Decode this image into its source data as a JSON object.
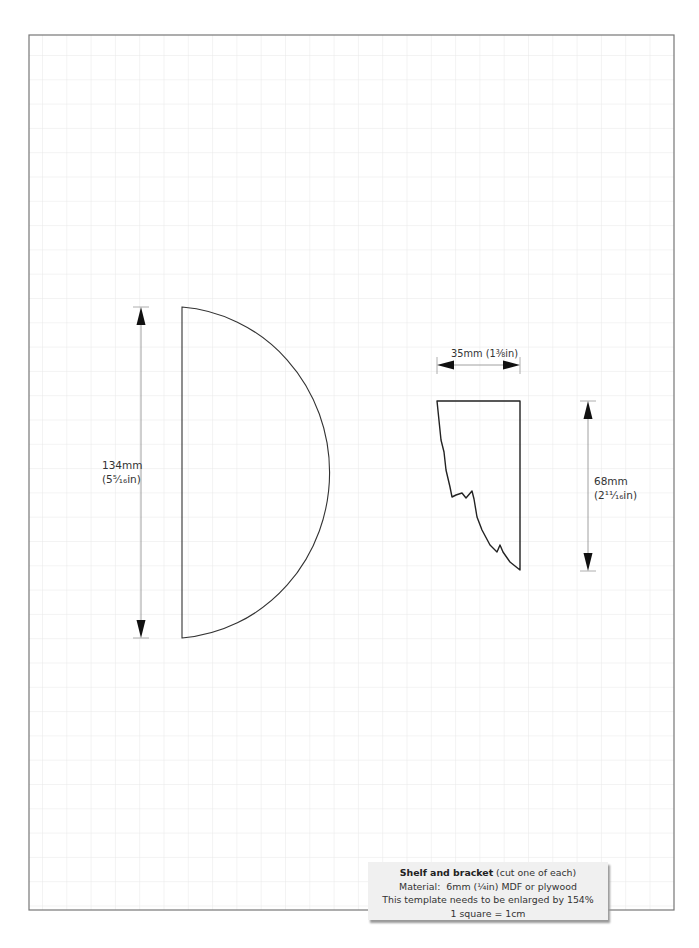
{
  "template": {
    "grid": {
      "unit": "1 square = 1cm",
      "spacing_px": 24.3,
      "line_color": "#e6e6e6",
      "frame_color": "#777777"
    },
    "shelf": {
      "shape": "half-circle",
      "dimension_label_mm": "134mm",
      "dimension_label_in": "(5⁵⁄₁₆in)"
    },
    "bracket": {
      "width_label": "35mm (1⅜in)",
      "height_label_mm": "68mm",
      "height_label_in": "(2¹¹⁄₁₆in)"
    },
    "caption": {
      "title": "Shelf and bracket",
      "title_note": " (cut one of each)",
      "material": "Material:  6mm (¼in) MDF or plywood",
      "enlarge": "This template needs to be enlarged by 154%",
      "scale": "1 square = 1cm"
    }
  }
}
